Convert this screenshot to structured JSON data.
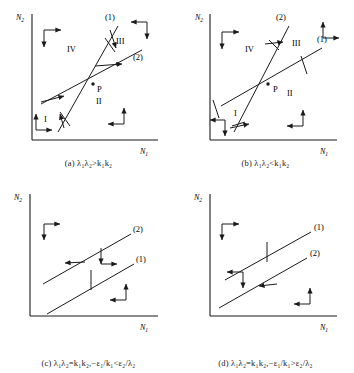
{
  "figure": {
    "type": "phase-plane-isocline-diagram",
    "background_color": "#ffffff",
    "ink_color": "#1a1a1a",
    "axis_labels": {
      "x": "N",
      "x_sub": "1",
      "y": "N",
      "y_sub": "2"
    }
  },
  "panels": [
    {
      "id": "a",
      "caption_tag": "(a)",
      "caption_expr": "λ₁λ₂>k₁k₂",
      "caption_full": "(a)  λ₁λ₂>k₁k₂",
      "x_axis_label": "N₁",
      "y_axis_label": "N₂",
      "intersection_label": "P",
      "lines": [
        {
          "name": "(1)",
          "label": "(1)",
          "kind": "steep-isocline"
        },
        {
          "name": "(2)",
          "label": "(2)",
          "kind": "shallow-isocline"
        }
      ],
      "regions": [
        {
          "label": "I",
          "arrows": [
            "up",
            "right"
          ]
        },
        {
          "label": "II",
          "arrows": [
            "up",
            "left"
          ]
        },
        {
          "label": "III",
          "arrows": [
            "left",
            "down"
          ]
        },
        {
          "label": "IV",
          "arrows": [
            "right",
            "down"
          ]
        }
      ]
    },
    {
      "id": "b",
      "caption_tag": "(b)",
      "caption_expr": "λ₁λ₂<k₁k₂",
      "caption_full": "(b)  λ₁λ₂<k₁k₂",
      "x_axis_label": "N₁",
      "y_axis_label": "N₂",
      "intersection_label": "P",
      "lines": [
        {
          "name": "(2)",
          "label": "(2)",
          "kind": "steep-isocline"
        },
        {
          "name": "(1)",
          "label": "(1)",
          "kind": "shallow-isocline"
        }
      ],
      "regions": [
        {
          "label": "I",
          "arrows": [
            "down",
            "left"
          ]
        },
        {
          "label": "II",
          "arrows": [
            "up",
            "left"
          ]
        },
        {
          "label": "III",
          "arrows": [
            "up",
            "right"
          ]
        },
        {
          "label": "IV",
          "arrows": [
            "right",
            "down"
          ]
        }
      ]
    },
    {
      "id": "c",
      "caption_tag": "(c)",
      "caption_expr": "λ₁λ₂=k₁k₂, −ε₁/k₁<ε₂/λ₂",
      "caption_full": "(c)  λ₁λ₂=k₁k₂,−ε₁/k₁<ε₂/λ₂",
      "x_axis_label": "N₁",
      "y_axis_label": "N₂",
      "intersection_label": "",
      "lines": [
        {
          "name": "(2)",
          "label": "(2)",
          "kind": "upper-parallel"
        },
        {
          "name": "(1)",
          "label": "(1)",
          "kind": "lower-parallel"
        }
      ],
      "regions": [
        {
          "label": "",
          "arrows": [
            "right",
            "down"
          ]
        },
        {
          "label": "",
          "arrows": [
            "down",
            "right"
          ]
        },
        {
          "label": "",
          "arrows": [
            "left",
            "up"
          ]
        }
      ]
    },
    {
      "id": "d",
      "caption_tag": "(d)",
      "caption_expr": "λ₁λ₂=k₁k₂, −ε₁/k₁>ε₂/λ₂",
      "caption_full": "(d)  λ₁λ₂=k₁k₂,−ε₁/k₁>ε₂/λ₂",
      "x_axis_label": "N₁",
      "y_axis_label": "N₂",
      "intersection_label": "",
      "lines": [
        {
          "name": "(1)",
          "label": "(1)",
          "kind": "upper-parallel"
        },
        {
          "name": "(2)",
          "label": "(2)",
          "kind": "lower-parallel"
        }
      ],
      "regions": [
        {
          "label": "",
          "arrows": [
            "right",
            "down"
          ]
        },
        {
          "label": "",
          "arrows": [
            "left",
            "down"
          ]
        },
        {
          "label": "",
          "arrows": [
            "left",
            "up"
          ]
        }
      ]
    }
  ]
}
